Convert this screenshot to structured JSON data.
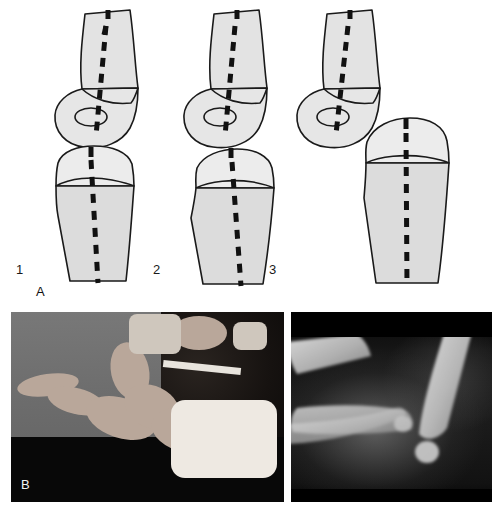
{
  "figure": {
    "type": "medical-illustration",
    "panels": [
      {
        "id": "A",
        "label": "A",
        "kind": "line-diagram-set"
      },
      {
        "id": "B",
        "label": "B",
        "kind": "photograph-set"
      }
    ]
  },
  "panel_a": {
    "label": "A",
    "diagrams": [
      {
        "number": "1",
        "name": "normal-alignment",
        "bones": [
          "humerus",
          "radius"
        ],
        "axis_line": "dashed",
        "capitellum_marker": "ellipse",
        "radial_head_marker": "ellipse"
      },
      {
        "number": "2",
        "name": "partial-subluxation",
        "bones": [
          "humerus",
          "radius"
        ],
        "axis_line": "dashed",
        "capitellum_marker": "ellipse",
        "radial_head_marker": "ellipse"
      },
      {
        "number": "3",
        "name": "complete-dislocation",
        "bones": [
          "humerus",
          "radius"
        ],
        "axis_line": "dashed",
        "capitellum_marker": "ellipse",
        "radial_head_marker": "ellipse"
      }
    ]
  },
  "panel_b": {
    "label": "B",
    "photos": [
      {
        "name": "clinical-photograph",
        "description": "infant clinical photograph",
        "overlay_label": "B"
      },
      {
        "name": "radiograph",
        "description": "lateral elbow radiograph",
        "overlay_label": ""
      }
    ]
  },
  "caption": {
    "cut_off_text": ""
  },
  "colors": {
    "bone_fill_light": "#e8e8e8",
    "bone_fill_mid": "#d4d4d4",
    "outline": "#1a1a1a",
    "axis_dash": "#111111",
    "page_background": "#ffffff",
    "photo_background": "#6f6f6f",
    "photo_shadow": "#080808",
    "xray_background": "#0d0d0d",
    "label_text": "#1a1a1a"
  }
}
